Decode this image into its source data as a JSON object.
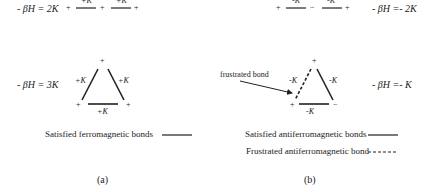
{
  "panel_a": {
    "chain": {
      "energy": "- βH = 2K",
      "spins": [
        "+",
        "+",
        "+"
      ],
      "bonds": [
        "+K",
        "+K"
      ]
    },
    "triangle": {
      "energy": "- βH = 3K",
      "spins": {
        "top": "+",
        "left": "+",
        "right": "+"
      },
      "bonds": {
        "left": "+K",
        "right": "+K",
        "bottom": "+K"
      }
    },
    "legend": [
      {
        "label": "Satisfied ferromagnetic bonds",
        "style": "solid"
      }
    ],
    "caption": "(a)"
  },
  "panel_b": {
    "chain": {
      "energy": "- βH =- 2K",
      "spins": [
        "+",
        "−",
        "+"
      ],
      "bonds": [
        "-K",
        "-K"
      ]
    },
    "triangle": {
      "energy": "- βH =- K",
      "spins": {
        "top": "+",
        "left": "+",
        "right": "−"
      },
      "bonds": {
        "left": "-K",
        "right": "-K",
        "bottom": "-K"
      },
      "annotation": "frustrated bond"
    },
    "legend": [
      {
        "label": "Satisfied antiferromagnetic bonds",
        "style": "solid"
      },
      {
        "label": "Frustrated antiferromagnetic bond",
        "style": "dashed"
      }
    ],
    "caption": "(b)"
  },
  "colors": {
    "line": "#222222",
    "background": "#ffffff"
  }
}
